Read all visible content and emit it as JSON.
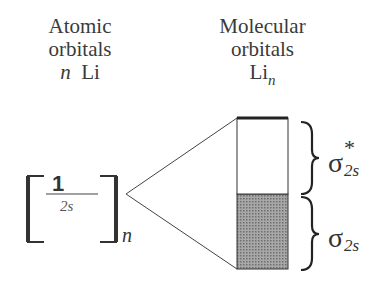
{
  "headers": {
    "atomic": {
      "line1": "Atomic",
      "line2": "orbitals",
      "line3_n": "n",
      "line3_el": "Li"
    },
    "molecular": {
      "line1": "Molecular",
      "line2": "orbitals",
      "line3_el": "Li",
      "line3_sub": "n"
    }
  },
  "atomic_orbital": {
    "electron_count": "1",
    "orbital": "2s",
    "multiplier": "n"
  },
  "band": {
    "antibonding": {
      "symbol": "σ",
      "superscript": "*",
      "subscript": "2s",
      "fill": "#ffffff"
    },
    "bonding": {
      "symbol": "σ",
      "subscript": "2s",
      "fill": "#8f8f8f"
    }
  },
  "colors": {
    "line": "#333333",
    "text": "#3a3a3a",
    "shade": "#8f8f8f"
  }
}
